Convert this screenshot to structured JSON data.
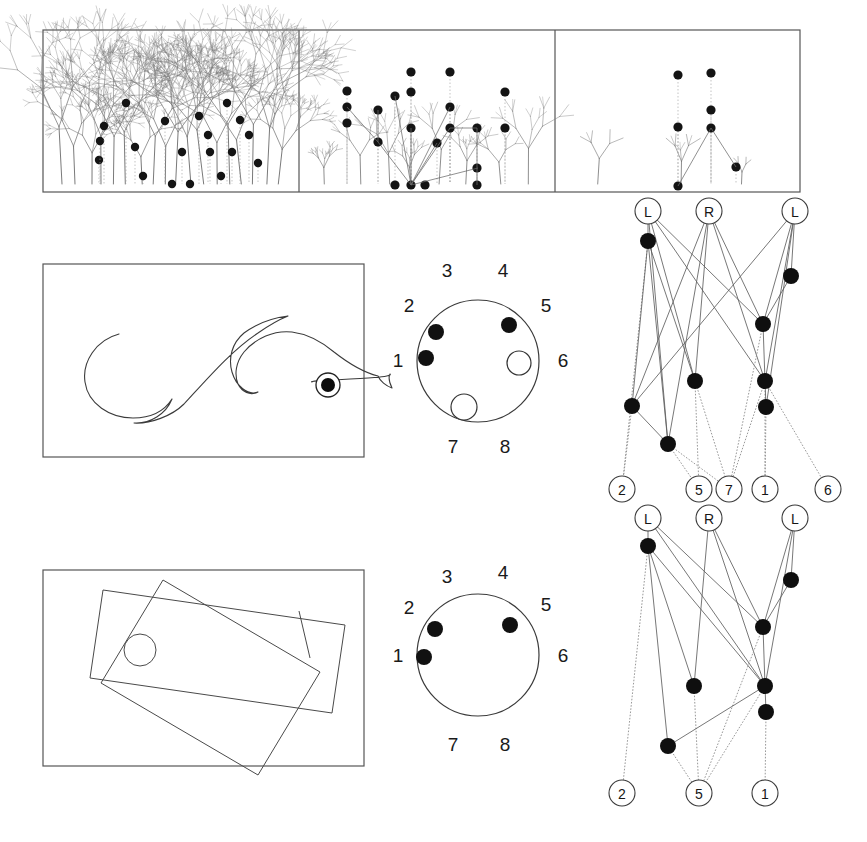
{
  "figure": {
    "title": "",
    "background": "#ffffff",
    "width": 867,
    "height": 842,
    "colors": {
      "ink": "#141414",
      "panel_stroke": "#555555",
      "branch_stroke": "#6b6b6b",
      "edge_stroke": "#5f5f5f",
      "node_fill": "#0f0f0f",
      "open_fill": "#ffffff"
    }
  },
  "chart_data": {
    "type": "diagram",
    "title": "",
    "panels": [
      {
        "id": "tree-panel-dense",
        "label": "",
        "role": "dendrogram-dense",
        "bounds": [
          43,
          30,
          256,
          162
        ],
        "leaf_dot_count": 19,
        "density": "high"
      },
      {
        "id": "tree-panel-medium",
        "label": "",
        "role": "dendrogram-medium",
        "bounds": [
          299,
          30,
          256,
          162
        ],
        "leaf_dot_count": 18,
        "density": "medium"
      },
      {
        "id": "tree-panel-sparse",
        "label": "",
        "role": "dendrogram-sparse",
        "bounds": [
          555,
          30,
          245,
          162
        ],
        "leaf_dot_count": 7,
        "density": "low"
      }
    ],
    "tree_dense_nodes": [
      [
        126,
        103
      ],
      [
        165,
        121
      ],
      [
        182,
        152
      ],
      [
        199,
        116
      ],
      [
        208,
        135
      ],
      [
        135,
        147
      ],
      [
        143,
        176
      ],
      [
        172,
        184
      ],
      [
        190,
        184
      ],
      [
        210,
        152
      ],
      [
        227,
        103
      ],
      [
        232,
        152
      ],
      [
        240,
        120
      ],
      [
        249,
        135
      ],
      [
        258,
        163
      ],
      [
        221,
        176
      ],
      [
        99,
        160
      ],
      [
        100,
        141
      ],
      [
        104,
        126
      ]
    ],
    "tree_medium_nodes": [
      [
        347,
        91
      ],
      [
        347,
        107
      ],
      [
        347,
        123
      ],
      [
        378,
        110
      ],
      [
        378,
        142
      ],
      [
        395,
        96
      ],
      [
        411,
        72
      ],
      [
        411,
        92
      ],
      [
        411,
        128
      ],
      [
        411,
        185
      ],
      [
        395,
        185
      ],
      [
        425,
        185
      ],
      [
        437,
        143
      ],
      [
        450,
        72
      ],
      [
        450,
        107
      ],
      [
        450,
        128
      ],
      [
        477,
        128
      ],
      [
        477,
        168
      ],
      [
        477,
        185
      ],
      [
        505,
        92
      ],
      [
        505,
        128
      ]
    ],
    "tree_sparse_nodes": [
      [
        678,
        75
      ],
      [
        678,
        127
      ],
      [
        678,
        186
      ],
      [
        711,
        73
      ],
      [
        711,
        110
      ],
      [
        711,
        128
      ],
      [
        736,
        167
      ]
    ],
    "trajectory_panel": {
      "id": "trajectory-panel",
      "bounds": [
        43,
        264,
        321,
        193
      ],
      "target": {
        "cx": 328,
        "cy": 385,
        "ring_r": 12,
        "core_r": 7
      },
      "path": "M 119 334 C 96 340 82 362 85 382 C 88 404 110 418 133 418 C 152 418 165 410 172 399 C 166 414 150 424 134 423 C 150 424 172 416 184 404 C 208 378 232 350 258 333 C 268 326 278 320 288 316 C 272 318 256 324 244 333 C 232 343 228 358 232 372 C 236 386 248 396 258 392 C 250 396 242 392 238 384 C 234 374 236 362 244 352 C 256 338 274 330 292 332 C 308 334 322 342 334 352 C 348 363 362 372 378 376 C 380 381 386 386 392 388 C 389 382 388 378 390 374 C 396 379 304 380 312 382"
    },
    "rect_panel": {
      "id": "rectangles-panel",
      "bounds": [
        43,
        570,
        321,
        196
      ],
      "rect_a": [
        [
          103,
          590
        ],
        [
          345,
          625
        ],
        [
          332,
          713
        ],
        [
          90,
          678
        ]
      ],
      "rect_b": [
        [
          101,
          683
        ],
        [
          163,
          580
        ],
        [
          320,
          672
        ],
        [
          258,
          775
        ]
      ],
      "hole": {
        "cx": 140,
        "cy": 650,
        "r": 16
      },
      "tick": [
        [
          299,
          611
        ],
        [
          310,
          658
        ]
      ]
    },
    "sensor_top": {
      "id": "sensor-circle-top",
      "center": [
        478,
        361
      ],
      "radius": 61,
      "labels": [
        {
          "text": "1",
          "x": 398,
          "y": 362
        },
        {
          "text": "2",
          "x": 409,
          "y": 307
        },
        {
          "text": "3",
          "x": 447,
          "y": 272
        },
        {
          "text": "4",
          "x": 503,
          "y": 272
        },
        {
          "text": "5",
          "x": 546,
          "y": 307
        },
        {
          "text": "6",
          "x": 563,
          "y": 362
        },
        {
          "text": "7",
          "x": 453,
          "y": 448
        },
        {
          "text": "8",
          "x": 505,
          "y": 448
        }
      ],
      "dots": [
        {
          "type": "filled",
          "cx": 436,
          "cy": 332,
          "r": 8
        },
        {
          "type": "filled",
          "cx": 509,
          "cy": 325,
          "r": 8
        },
        {
          "type": "filled",
          "cx": 426,
          "cy": 358,
          "r": 8
        },
        {
          "type": "open",
          "cx": 519,
          "cy": 363,
          "r": 12
        },
        {
          "type": "open",
          "cx": 464,
          "cy": 407,
          "r": 13
        }
      ]
    },
    "sensor_bottom": {
      "id": "sensor-circle-bottom",
      "center": [
        478,
        655
      ],
      "radius": 61,
      "labels": [
        {
          "text": "1",
          "x": 398,
          "y": 657
        },
        {
          "text": "2",
          "x": 409,
          "y": 609
        },
        {
          "text": "3",
          "x": 447,
          "y": 578
        },
        {
          "text": "4",
          "x": 503,
          "y": 574
        },
        {
          "text": "5",
          "x": 546,
          "y": 606
        },
        {
          "text": "6",
          "x": 563,
          "y": 657
        },
        {
          "text": "7",
          "x": 453,
          "y": 746
        },
        {
          "text": "8",
          "x": 505,
          "y": 746
        }
      ],
      "dots": [
        {
          "type": "filled",
          "cx": 435,
          "cy": 629,
          "r": 8
        },
        {
          "type": "filled",
          "cx": 510,
          "cy": 625,
          "r": 8
        },
        {
          "type": "filled",
          "cx": 424,
          "cy": 657,
          "r": 8
        }
      ]
    },
    "network_top": {
      "id": "network-top",
      "top_nodes": [
        {
          "label": "L",
          "x": 648,
          "y": 211,
          "r": 13
        },
        {
          "label": "R",
          "x": 709,
          "y": 211,
          "r": 13
        },
        {
          "label": "L",
          "x": 795,
          "y": 211,
          "r": 13
        }
      ],
      "bottom_nodes": [
        {
          "label": "2",
          "x": 622,
          "y": 489,
          "r": 13
        },
        {
          "label": "5",
          "x": 699,
          "y": 489,
          "r": 13
        },
        {
          "label": "7",
          "x": 729,
          "y": 489,
          "r": 13
        },
        {
          "label": "1",
          "x": 765,
          "y": 489,
          "r": 13
        },
        {
          "label": "6",
          "x": 828,
          "y": 489,
          "r": 13
        }
      ],
      "hidden_nodes": [
        {
          "id": "h0",
          "x": 648,
          "y": 241,
          "r": 8
        },
        {
          "id": "h1",
          "x": 791,
          "y": 276,
          "r": 8
        },
        {
          "id": "h2",
          "x": 763,
          "y": 324,
          "r": 8
        },
        {
          "id": "h3",
          "x": 695,
          "y": 381,
          "r": 8
        },
        {
          "id": "h4",
          "x": 765,
          "y": 381,
          "r": 8
        },
        {
          "id": "h5",
          "x": 632,
          "y": 406,
          "r": 8
        },
        {
          "id": "h6",
          "x": 766,
          "y": 407,
          "r": 8
        },
        {
          "id": "h7",
          "x": 668,
          "y": 444,
          "r": 8
        }
      ],
      "edges": [
        [
          "L0",
          "h0"
        ],
        [
          "L0",
          "h2"
        ],
        [
          "L0",
          "h3"
        ],
        [
          "L0",
          "h4"
        ],
        [
          "L0",
          "h7"
        ],
        [
          "R0",
          "h3"
        ],
        [
          "R0",
          "h4"
        ],
        [
          "R0",
          "h5"
        ],
        [
          "R0",
          "h7"
        ],
        [
          "R0",
          "h2"
        ],
        [
          "L1",
          "h1"
        ],
        [
          "L1",
          "h4"
        ],
        [
          "L1",
          "h2"
        ],
        [
          "L1",
          "h5"
        ],
        [
          "L1",
          "h6"
        ],
        [
          "h0",
          "n2"
        ],
        [
          "h0",
          "h7"
        ],
        [
          "h0",
          "h3"
        ],
        [
          "h0",
          "h5"
        ],
        [
          "h1",
          "h2"
        ],
        [
          "h2",
          "h4"
        ],
        [
          "h2",
          "n7"
        ],
        [
          "h3",
          "n5"
        ],
        [
          "h3",
          "n7"
        ],
        [
          "h4",
          "n7"
        ],
        [
          "h4",
          "n1"
        ],
        [
          "h4",
          "h6"
        ],
        [
          "h4",
          "n6"
        ],
        [
          "h5",
          "n2"
        ],
        [
          "h5",
          "h7"
        ],
        [
          "h6",
          "n1"
        ],
        [
          "h7",
          "n5"
        ],
        [
          "h7",
          "n7"
        ]
      ]
    },
    "network_bottom": {
      "id": "network-bottom",
      "top_nodes": [
        {
          "label": "L",
          "x": 648,
          "y": 518,
          "r": 13
        },
        {
          "label": "R",
          "x": 709,
          "y": 518,
          "r": 13
        },
        {
          "label": "L",
          "x": 795,
          "y": 518,
          "r": 13
        }
      ],
      "bottom_nodes": [
        {
          "label": "2",
          "x": 622,
          "y": 793,
          "r": 13
        },
        {
          "label": "5",
          "x": 699,
          "y": 793,
          "r": 13
        },
        {
          "label": "1",
          "x": 765,
          "y": 793,
          "r": 13
        }
      ],
      "hidden_nodes": [
        {
          "id": "h0",
          "x": 648,
          "y": 546,
          "r": 8
        },
        {
          "id": "h1",
          "x": 791,
          "y": 580,
          "r": 8
        },
        {
          "id": "h2",
          "x": 763,
          "y": 627,
          "r": 8
        },
        {
          "id": "h3",
          "x": 694,
          "y": 686,
          "r": 8
        },
        {
          "id": "h4",
          "x": 765,
          "y": 686,
          "r": 8
        },
        {
          "id": "h5",
          "x": 766,
          "y": 712,
          "r": 8
        },
        {
          "id": "h6",
          "x": 668,
          "y": 746,
          "r": 8
        }
      ],
      "edges": [
        [
          "L0",
          "h0"
        ],
        [
          "L0",
          "h2"
        ],
        [
          "L0",
          "h4"
        ],
        [
          "R0",
          "h3"
        ],
        [
          "R0",
          "h2"
        ],
        [
          "R0",
          "h4"
        ],
        [
          "L1",
          "h1"
        ],
        [
          "L1",
          "h2"
        ],
        [
          "L1",
          "h4"
        ],
        [
          "h0",
          "h3"
        ],
        [
          "h0",
          "h4"
        ],
        [
          "h0",
          "h6"
        ],
        [
          "h0",
          "n2"
        ],
        [
          "h1",
          "h2"
        ],
        [
          "h2",
          "h4"
        ],
        [
          "h2",
          "n5"
        ],
        [
          "h3",
          "n5"
        ],
        [
          "h4",
          "n5"
        ],
        [
          "h4",
          "h5"
        ],
        [
          "h4",
          "h6"
        ],
        [
          "h5",
          "n1"
        ],
        [
          "h6",
          "n5"
        ]
      ]
    }
  }
}
